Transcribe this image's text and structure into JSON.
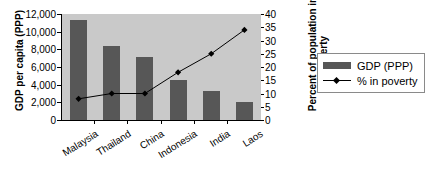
{
  "chart_data": {
    "type": "bar",
    "title": "",
    "categories": [
      "Malaysia",
      "Thailand",
      "China",
      "Indonesia",
      "India",
      "Laos"
    ],
    "series": [
      {
        "name": "GDP (PPP)",
        "type": "bar",
        "axis": "left",
        "values": [
          11300,
          8350,
          7150,
          4500,
          3300,
          2050
        ],
        "color": "#575757"
      },
      {
        "name": "% in poverty",
        "type": "line",
        "axis": "right",
        "values": [
          8,
          10,
          10,
          18,
          25,
          34
        ],
        "color": "#000000"
      }
    ],
    "xlabel": "",
    "ylabel": "GDP per capita (PPP)",
    "ylabel_right_line1": "Percent of population in",
    "ylabel_right_line2": "poverty",
    "ylim": [
      0,
      12000
    ],
    "ylim_right": [
      0,
      40
    ],
    "yticks": [
      "0",
      "2,000",
      "4,000",
      "6,000",
      "8,000",
      "10,000",
      "12,000"
    ],
    "yticks_right": [
      "0",
      "5",
      "10",
      "15",
      "20",
      "25",
      "30",
      "35",
      "40"
    ],
    "grid": false,
    "legend_position": "right",
    "plot_background": "#c9c9c9"
  },
  "legend": {
    "items": [
      {
        "label": "GDP (PPP)"
      },
      {
        "label": "% in poverty"
      }
    ]
  }
}
